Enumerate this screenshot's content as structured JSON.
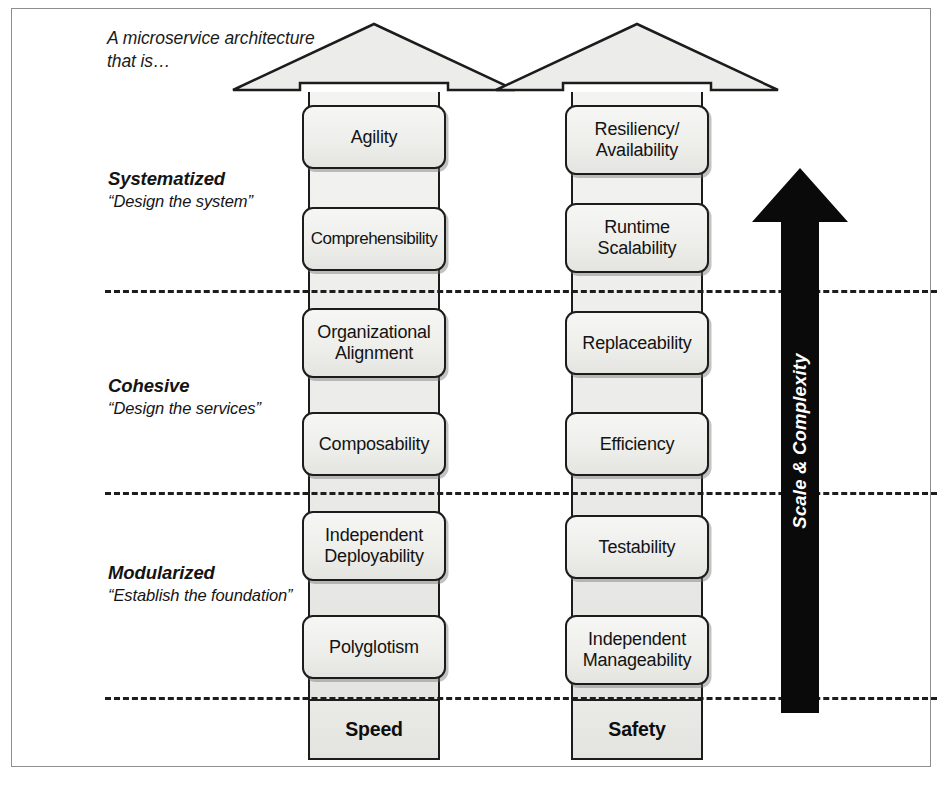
{
  "figure": {
    "caption": "A microservice architecture that is…",
    "tiers": [
      {
        "id": "systematized",
        "title": "Systematized",
        "subtitle": "“Design the system”"
      },
      {
        "id": "cohesive",
        "title": "Cohesive",
        "subtitle": "“Design the services”"
      },
      {
        "id": "modularized",
        "title": "Modularized",
        "subtitle": "“Establish the foundation”"
      }
    ],
    "pillars": [
      {
        "id": "speed",
        "base_label": "Speed",
        "boxes": [
          {
            "label": "Agility"
          },
          {
            "label": "Comprehensibility"
          },
          {
            "label": "Organizational Alignment"
          },
          {
            "label": "Composability"
          },
          {
            "label": "Independent Deployability"
          },
          {
            "label": "Polyglotism"
          }
        ]
      },
      {
        "id": "safety",
        "base_label": "Safety",
        "boxes": [
          {
            "label": "Resiliency/ Availability"
          },
          {
            "label": "Runtime Scalability"
          },
          {
            "label": "Replaceability"
          },
          {
            "label": "Efficiency"
          },
          {
            "label": "Testability"
          },
          {
            "label": "Independent Manageability"
          }
        ]
      }
    ],
    "scale_arrow": {
      "label": "Scale & Complexity",
      "direction": "up"
    },
    "colors": {
      "frame_border": "#8e8e8e",
      "outline": "#1c1c1c",
      "box_fill": "#eeeeeb",
      "shaft_fill": "#e9e9e6",
      "arrow_fill": "#0a0a0a",
      "arrow_text": "#ffffff",
      "text": "#131313",
      "divider": "#1d1d1d"
    }
  }
}
